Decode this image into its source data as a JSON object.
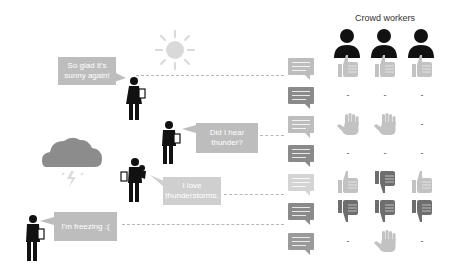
{
  "header": {
    "title": "Crowd workers"
  },
  "colors": {
    "bubble": "#bdbdbd",
    "bubble_light": "#cfcfcf",
    "chat_light": "#bdbdbd",
    "chat_dark": "#8a8a8a",
    "chat_lighter": "#d4d4d4",
    "thumb_light": "#c2c2c2",
    "thumb_dark": "#6e6e6e",
    "person": "#111111",
    "sun": "#d9d9d9",
    "cloud": "#8c8c8c"
  },
  "speakers": [
    {
      "id": "speaker-1",
      "text_line1": "So glad it's",
      "text_line2": "sunny again!"
    },
    {
      "id": "speaker-2",
      "text_line1": "Did I hear",
      "text_line2": "thunder?"
    },
    {
      "id": "speaker-3",
      "text_line1": "I love",
      "text_line2": "thunderstorms."
    },
    {
      "id": "speaker-4",
      "text_line1": "I'm freezing :(",
      "text_line2": ""
    }
  ],
  "grid": {
    "rows": [
      {
        "chat_shade": "light",
        "votes": [
          "thumbs-up",
          "thumbs-up",
          "thumbs-up"
        ]
      },
      {
        "chat_shade": "dark",
        "votes": [
          "-",
          "-",
          "-"
        ]
      },
      {
        "chat_shade": "light",
        "votes": [
          "hand",
          "hand",
          "-"
        ]
      },
      {
        "chat_shade": "dark",
        "votes": [
          "-",
          "-",
          "-"
        ]
      },
      {
        "chat_shade": "lighter",
        "votes": [
          "thumbs-up",
          "thumbs-down",
          "thumbs-up"
        ]
      },
      {
        "chat_shade": "dark",
        "votes": [
          "thumbs-down",
          "thumbs-down",
          "thumbs-down"
        ]
      },
      {
        "chat_shade": "mid",
        "votes": [
          "-",
          "hand",
          "-"
        ]
      }
    ],
    "dash_label": "-"
  }
}
